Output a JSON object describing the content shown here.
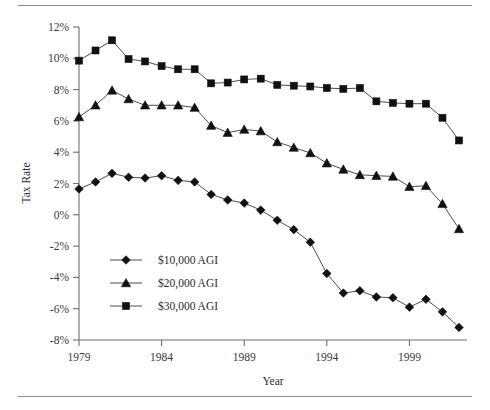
{
  "figure": {
    "top_rule": "horizontal-rule",
    "bottom_rule": "horizontal-rule"
  },
  "chart_data": {
    "type": "line",
    "title": "",
    "xlabel": "Year",
    "ylabel": "Tax Rate",
    "x": [
      1979,
      1980,
      1981,
      1982,
      1983,
      1984,
      1985,
      1986,
      1987,
      1988,
      1989,
      1990,
      1991,
      1992,
      1993,
      1994,
      1995,
      1996,
      1997,
      1998,
      1999,
      2000,
      2001,
      2002
    ],
    "xlim": [
      1979,
      2002
    ],
    "ylim": [
      -8,
      12
    ],
    "xticks": [
      1979,
      1984,
      1989,
      1994,
      1999
    ],
    "xtick_labels": [
      "1979",
      "1984",
      "1989",
      "1994",
      "1999"
    ],
    "yticks": [
      12,
      10,
      8,
      6,
      4,
      2,
      0,
      -2,
      -4,
      -6,
      -8
    ],
    "ytick_labels": [
      "12%",
      "10%",
      "8%",
      "6%",
      "4%",
      "2%",
      "0%",
      "-2%",
      "-4%",
      "-6%",
      "-8%"
    ],
    "grid": false,
    "legend_position": "lower-left-inside",
    "series": [
      {
        "name": "$10,000 AGI",
        "marker": "diamond",
        "values": [
          1.65,
          2.1,
          2.65,
          2.4,
          2.35,
          2.5,
          2.2,
          2.1,
          1.3,
          0.95,
          0.75,
          0.3,
          -0.35,
          -0.95,
          -1.75,
          -3.75,
          -5.0,
          -4.85,
          -5.25,
          -5.3,
          -5.9,
          -5.4,
          -6.2,
          -7.2
        ]
      },
      {
        "name": "$20,000 AGI",
        "marker": "triangle",
        "values": [
          6.25,
          7.0,
          7.95,
          7.4,
          7.0,
          7.0,
          7.0,
          6.85,
          5.7,
          5.25,
          5.45,
          5.35,
          4.65,
          4.3,
          3.95,
          3.3,
          2.9,
          2.55,
          2.5,
          2.45,
          1.8,
          1.85,
          0.7,
          -0.9
        ]
      },
      {
        "name": "$30,000 AGI",
        "marker": "square",
        "values": [
          9.85,
          10.5,
          11.15,
          9.95,
          9.8,
          9.5,
          9.3,
          9.3,
          8.4,
          8.45,
          8.65,
          8.7,
          8.3,
          8.25,
          8.2,
          8.1,
          8.05,
          8.1,
          7.25,
          7.15,
          7.1,
          7.1,
          6.2,
          4.75
        ]
      }
    ]
  },
  "legend": {
    "items": [
      {
        "label": "$10,000 AGI",
        "marker": "diamond-marker"
      },
      {
        "label": "$20,000 AGI",
        "marker": "triangle-marker"
      },
      {
        "label": "$30,000 AGI",
        "marker": "square-marker"
      }
    ]
  },
  "colors": {
    "marker": "#111111",
    "line": "#3a3a3a",
    "axis": "#6f6f6f",
    "rule": "#8a8a8a",
    "text": "#2b2b2b",
    "background": "#ffffff"
  }
}
